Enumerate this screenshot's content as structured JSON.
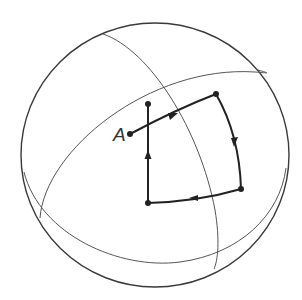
{
  "diagram": {
    "labels": {
      "point_a": "A"
    },
    "colors": {
      "background": "#ffffff",
      "sphere_outline": "#3a3a3a",
      "grid_lines": "#555555",
      "path": "#222222"
    },
    "elements": {
      "sphere": "sphere-outline",
      "equator": "equator-curve",
      "meridian": "meridian-curve",
      "loop": [
        "vertex-bottom-left",
        "vertex-top-left",
        "vertex-top-right",
        "vertex-bottom-right"
      ],
      "arrows": [
        "arrow-up",
        "arrow-right",
        "arrow-down",
        "arrow-left"
      ]
    }
  }
}
